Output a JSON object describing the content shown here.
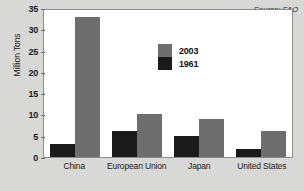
{
  "chart_data": {
    "type": "bar",
    "title": "",
    "xlabel": "",
    "ylabel": "Million Tons",
    "ylim": [
      0,
      35
    ],
    "yticks": [
      0,
      5,
      10,
      15,
      20,
      25,
      30,
      35
    ],
    "ytick_labels": [
      "0",
      "5",
      "10",
      "15",
      "20",
      "25",
      "30",
      "35"
    ],
    "grid": false,
    "legend_position": "inside-top-center",
    "categories": [
      "China",
      "European Union",
      "Japan",
      "United States"
    ],
    "series": [
      {
        "name": "1961",
        "color": "#1a1a1a",
        "values": [
          3,
          6,
          5,
          2
        ]
      },
      {
        "name": "2003",
        "color": "#6e6e6e",
        "values": [
          33,
          10,
          9,
          6
        ]
      }
    ],
    "annotations": [
      {
        "name": "source-note",
        "text": "Source: FAO"
      }
    ]
  },
  "colors": {
    "series_1961": "#1a1a1a",
    "series_2003": "#6e6e6e",
    "figure_background": "#d8d8d6",
    "plot_background": "#ffffff",
    "axis": "#8c8c8c"
  }
}
